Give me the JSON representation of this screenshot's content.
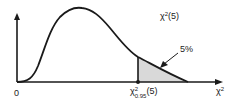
{
  "diagram": {
    "curve_label": {
      "base": "χ",
      "sup": "2",
      "rest": "(5)"
    },
    "origin_label": "0",
    "x_axis_label": {
      "base": "χ",
      "sup": "2"
    },
    "critical_label": {
      "base": "χ",
      "sup": "2",
      "sub": "0.95",
      "rest": "(5)"
    },
    "tail_label": "5%",
    "colors": {
      "line": "#1a1a1a",
      "shade": "#d9d9d9"
    }
  }
}
